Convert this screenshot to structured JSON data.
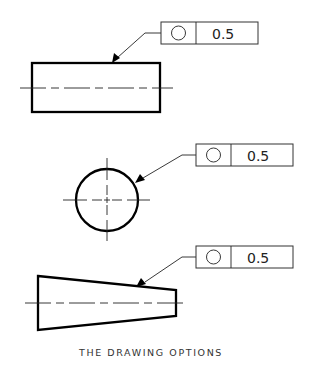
{
  "caption": "THE DRAWING OPTIONS",
  "colors": {
    "line": "#000000",
    "background": "#ffffff",
    "caption": "#333333"
  },
  "callouts": [
    {
      "feature": "cylinder-side-view",
      "symbol": "circularity-icon",
      "tolerance": "0.5"
    },
    {
      "feature": "circle-end-view",
      "symbol": "circularity-icon",
      "tolerance": "0.5"
    },
    {
      "feature": "cone-side-view",
      "symbol": "circularity-icon",
      "tolerance": "0.5"
    }
  ]
}
